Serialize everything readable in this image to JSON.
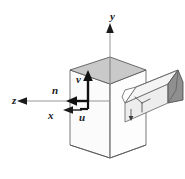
{
  "figure": {
    "type": "technical-line-diagram",
    "background_color": "#ffffff"
  },
  "labels": {
    "axis_y": "y",
    "axis_z": "z",
    "axis_x": "x",
    "vector_n": "n",
    "vector_v": "v",
    "vector_u": "u"
  },
  "colors": {
    "stroke": "#1a1a1a",
    "thin_stroke": "#4d4d4d",
    "hidden_edge": "#8c8c8c",
    "top_face_fill": "#c9c9c9",
    "prism_body_fill": "#e8e8e8",
    "prism_end_fill": "#8f8f8f",
    "white": "#ffffff"
  },
  "geometry": {
    "world_origin_px": [
      110,
      101
    ],
    "local_frame_origin_px": [
      88,
      101
    ],
    "box_top_vertex_px": [
      110,
      57
    ],
    "box_left_px": 70,
    "box_right_px": 146,
    "box_bottom_px": 158
  }
}
